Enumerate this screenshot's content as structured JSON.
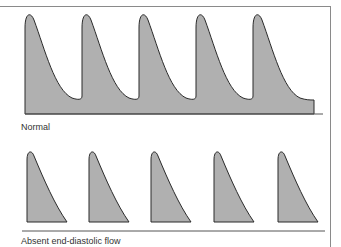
{
  "panels": [
    {
      "id": "normal",
      "label": "Normal",
      "peaks": 5,
      "description": "Continuous forward flow with diastolic flow never reaching baseline"
    },
    {
      "id": "absent",
      "label": "Absent end-diastolic flow",
      "peaks": 5,
      "description": "Systolic peaks with flow returning to baseline before next cycle"
    }
  ],
  "colors": {
    "fill": "#b0b0b0",
    "stroke": "#2a2a2a",
    "frame": "#8a8a8a"
  }
}
